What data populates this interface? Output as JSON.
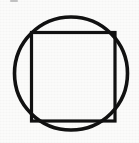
{
  "image": {
    "title": "Square inscribed in a circle",
    "kind": "line-diagram",
    "width": 139,
    "height": 143,
    "background_color": "#fbfbfa",
    "ink_color": "#111111",
    "paper_texture": true
  },
  "chart_data": {
    "type": "diagram",
    "subtitle": "",
    "xlabel": "",
    "ylabel": "",
    "grid": false,
    "legend": "none",
    "xlim": [
      0,
      139
    ],
    "ylim": [
      0,
      143
    ],
    "annotations": [],
    "tick_labels": [],
    "shapes": [
      {
        "name": "outer-circle",
        "type": "circle",
        "cx": 71,
        "cy": 73.5,
        "r": 56.5,
        "stroke": "#111111",
        "stroke_width": 3.6,
        "fill": "none"
      },
      {
        "name": "inscribed-square",
        "type": "rect",
        "x": 31.5,
        "y": 32.5,
        "width": 83.5,
        "height": 88.5,
        "stroke": "#111111",
        "stroke_width": 3.2,
        "fill": "none"
      }
    ],
    "artifacts": [
      {
        "name": "scan-smudge",
        "type": "smudge",
        "x": 10,
        "y": 0,
        "width": 8,
        "height": 2,
        "color": "#b9b9b9"
      }
    ]
  },
  "figure": {
    "circle_label": "outer circle",
    "square_label": "inscribed square",
    "smudge_label": "scan artifact"
  }
}
